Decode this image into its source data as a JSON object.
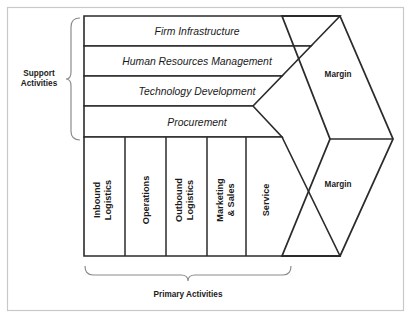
{
  "diagram": {
    "support": {
      "group_label_line1": "Support",
      "group_label_line2": "Activities",
      "rows": [
        {
          "label": "Firm Infrastructure"
        },
        {
          "label": "Human Resources Management"
        },
        {
          "label": "Technology Development"
        },
        {
          "label": "Procurement"
        }
      ]
    },
    "primary": {
      "group_label": "Primary Activities",
      "columns": [
        {
          "line1": "Inbound",
          "line2": "Logistics"
        },
        {
          "line1": "Operations",
          "line2": ""
        },
        {
          "line1": "Outbound",
          "line2": "Logistics"
        },
        {
          "line1": "Marketing",
          "line2": "& Sales"
        },
        {
          "line1": "Service",
          "line2": ""
        }
      ]
    },
    "margins": [
      {
        "label": "Margin"
      },
      {
        "label": "Margin"
      }
    ],
    "colors": {
      "stroke": "#2b2b2b",
      "frame": "#c9c9c9",
      "brace": "#8c8c8c",
      "background": "#ffffff",
      "text": "#1a1a1a"
    }
  }
}
